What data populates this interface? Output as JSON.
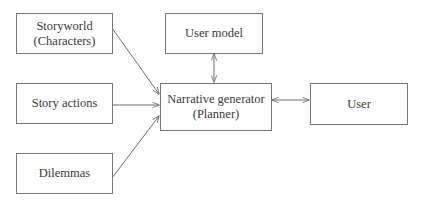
{
  "diagram": {
    "nodes": [
      {
        "id": "storyworld",
        "lines": [
          "Storyworld",
          "(Characters)"
        ]
      },
      {
        "id": "story-actions",
        "lines": [
          "Story actions"
        ]
      },
      {
        "id": "dilemmas",
        "lines": [
          "Dilemmas"
        ]
      },
      {
        "id": "user-model",
        "lines": [
          "User model"
        ]
      },
      {
        "id": "narrative-generator",
        "lines": [
          "Narrative generator",
          "(Planner)"
        ]
      },
      {
        "id": "user",
        "lines": [
          "User"
        ]
      }
    ],
    "edges": [
      {
        "from": "storyworld",
        "to": "narrative-generator",
        "direction": "forward"
      },
      {
        "from": "story-actions",
        "to": "narrative-generator",
        "direction": "forward"
      },
      {
        "from": "dilemmas",
        "to": "narrative-generator",
        "direction": "forward"
      },
      {
        "from": "user-model",
        "to": "narrative-generator",
        "direction": "both"
      },
      {
        "from": "narrative-generator",
        "to": "user",
        "direction": "both"
      }
    ],
    "line_color": "#6e6e6e",
    "border_color": "#777777"
  }
}
